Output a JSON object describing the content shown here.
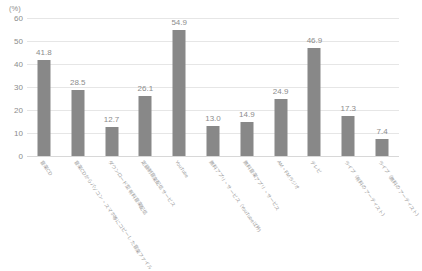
{
  "chart_data": {
    "type": "bar",
    "title": "",
    "subtitle": "",
    "xlabel": "",
    "ylabel": "(%)",
    "unit_caption": "(%)",
    "ylim": [
      0,
      60
    ],
    "y_ticks": [
      0,
      10,
      20,
      30,
      40,
      50,
      60
    ],
    "y_tick_labels": [
      "0",
      "10",
      "20",
      "30",
      "40",
      "50",
      "60"
    ],
    "grid": true,
    "grid_axis": "y",
    "legend": false,
    "legend_position": "none",
    "bar_color": "#888888",
    "gridline_color": "#e6e6e6",
    "text_color": "#8c8c8c",
    "background_color": "#ffffff",
    "categories": [
      "音楽CD",
      "音楽CDからパソコン・スマホ等にコピーした音楽ファイル",
      "ダウンロード型有料音楽配信",
      "定額制音楽配信サービス",
      "YouTube",
      "無料アプリ・サービス（YouTube以外）",
      "無料音楽アプリ・サービス",
      "AM・FMラジオ",
      "テレビ",
      "ライブ（有料のアーティスト）",
      "ライブ（無料のアーティスト）"
    ],
    "values": [
      41.8,
      28.5,
      12.7,
      26.1,
      54.9,
      13.0,
      14.9,
      24.9,
      46.9,
      17.3,
      7.4
    ],
    "value_labels": [
      "41.8",
      "28.5",
      "12.7",
      "26.1",
      "54.9",
      "13.0",
      "14.9",
      "24.9",
      "46.9",
      "17.3",
      "7.4"
    ]
  }
}
